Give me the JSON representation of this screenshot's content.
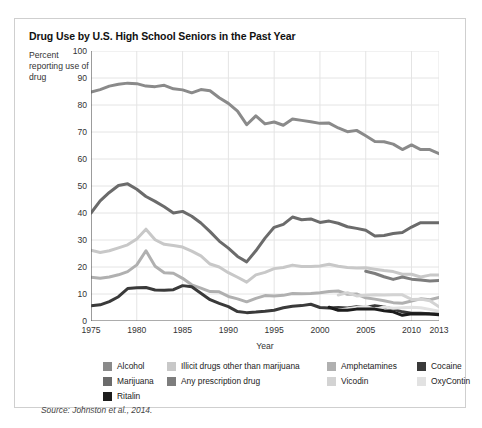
{
  "figure": {
    "title": "Drug Use by U.S. High School Seniors in the Past Year",
    "y_axis_caption": "Percent reporting use of drug",
    "source": "Source: Johnston et al., 2014."
  },
  "chart_data": {
    "type": "line",
    "title": "Drug Use by U.S. High School Seniors in the Past Year",
    "xlabel": "Year",
    "ylabel": "Percent reporting use of drug",
    "xlim": [
      1975,
      2013
    ],
    "ylim": [
      0,
      100
    ],
    "xticks": [
      1975,
      1980,
      1985,
      1990,
      1995,
      2000,
      2005,
      2010,
      2013
    ],
    "yticks": [
      0,
      10,
      20,
      30,
      40,
      50,
      60,
      70,
      80,
      90,
      100
    ],
    "grid": true,
    "legend_position": "below",
    "x": [
      1975,
      1976,
      1977,
      1978,
      1979,
      1980,
      1981,
      1982,
      1983,
      1984,
      1985,
      1986,
      1987,
      1988,
      1989,
      1990,
      1991,
      1992,
      1993,
      1994,
      1995,
      1996,
      1997,
      1998,
      1999,
      2000,
      2001,
      2002,
      2003,
      2004,
      2005,
      2006,
      2007,
      2008,
      2009,
      2010,
      2011,
      2012,
      2013
    ],
    "series": [
      {
        "name": "Alcohol",
        "color": "#8a8a8a",
        "x": [
          1975,
          1976,
          1977,
          1978,
          1979,
          1980,
          1981,
          1982,
          1983,
          1984,
          1985,
          1986,
          1987,
          1988,
          1989,
          1990,
          1991,
          1992,
          1993,
          1994,
          1995,
          1996,
          1997,
          1998,
          1999,
          2000,
          2001,
          2002,
          2003,
          2004,
          2005,
          2006,
          2007,
          2008,
          2009,
          2010,
          2011,
          2012,
          2013
        ],
        "values": [
          84.8,
          85.7,
          87.0,
          87.7,
          88.1,
          87.9,
          87.0,
          86.8,
          87.3,
          86.0,
          85.6,
          84.5,
          85.7,
          85.3,
          82.7,
          80.6,
          77.7,
          72.7,
          76.0,
          73.0,
          73.7,
          72.5,
          74.8,
          74.3,
          73.8,
          73.2,
          73.3,
          71.5,
          70.1,
          70.6,
          68.6,
          66.5,
          66.4,
          65.5,
          63.5,
          65.2,
          63.5,
          63.5,
          62.0
        ]
      },
      {
        "name": "Marijuana",
        "color": "#6b6b6b",
        "x": [
          1975,
          1976,
          1977,
          1978,
          1979,
          1980,
          1981,
          1982,
          1983,
          1984,
          1985,
          1986,
          1987,
          1988,
          1989,
          1990,
          1991,
          1992,
          1993,
          1994,
          1995,
          1996,
          1997,
          1998,
          1999,
          2000,
          2001,
          2002,
          2003,
          2004,
          2005,
          2006,
          2007,
          2008,
          2009,
          2010,
          2011,
          2012,
          2013
        ],
        "values": [
          40.0,
          44.5,
          47.6,
          50.2,
          50.8,
          48.8,
          46.1,
          44.3,
          42.3,
          40.0,
          40.6,
          38.8,
          36.3,
          33.1,
          29.6,
          27.0,
          23.9,
          21.9,
          26.0,
          30.7,
          34.7,
          35.8,
          38.5,
          37.5,
          37.8,
          36.5,
          37.0,
          36.2,
          34.9,
          34.3,
          33.6,
          31.5,
          31.7,
          32.4,
          32.8,
          34.8,
          36.4,
          36.4,
          36.4
        ]
      },
      {
        "name": "Illicit drugs other than marijuana",
        "color": "#c8c8c8",
        "x": [
          1975,
          1976,
          1977,
          1978,
          1979,
          1980,
          1981,
          1982,
          1983,
          1984,
          1985,
          1986,
          1987,
          1988,
          1989,
          1990,
          1991,
          1992,
          1993,
          1994,
          1995,
          1996,
          1997,
          1998,
          1999,
          2000,
          2001,
          2002,
          2003,
          2004,
          2005,
          2006,
          2007,
          2008,
          2009,
          2010,
          2011,
          2012,
          2013
        ],
        "values": [
          26.2,
          25.4,
          26.0,
          27.1,
          28.2,
          30.4,
          34.0,
          30.1,
          28.4,
          28.0,
          27.4,
          25.9,
          24.1,
          21.1,
          20.0,
          17.9,
          16.2,
          14.4,
          17.1,
          18.0,
          19.4,
          19.8,
          20.7,
          20.2,
          20.2,
          20.4,
          21.0,
          20.3,
          19.8,
          19.6,
          19.7,
          19.2,
          18.7,
          18.3,
          17.3,
          17.3,
          16.3,
          17.0,
          17.0
        ]
      },
      {
        "name": "Any prescription drug",
        "color": "#7d7d7d",
        "x": [
          2005,
          2006,
          2007,
          2008,
          2009,
          2010,
          2011,
          2012,
          2013
        ],
        "values": [
          18.4,
          17.6,
          16.4,
          15.4,
          16.3,
          15.5,
          15.2,
          14.8,
          15.0
        ]
      },
      {
        "name": "Amphetamines",
        "color": "#b0b0b0",
        "x": [
          1975,
          1976,
          1977,
          1978,
          1979,
          1980,
          1981,
          1982,
          1983,
          1984,
          1985,
          1986,
          1987,
          1988,
          1989,
          1990,
          1991,
          1992,
          1993,
          1994,
          1995,
          1996,
          1997,
          1998,
          1999,
          2000,
          2001,
          2002,
          2003,
          2004,
          2005,
          2006,
          2007,
          2008,
          2009,
          2010,
          2011,
          2012,
          2013
        ],
        "values": [
          16.2,
          15.8,
          16.3,
          17.1,
          18.3,
          20.8,
          26.0,
          20.3,
          17.9,
          17.7,
          15.8,
          13.4,
          12.2,
          10.9,
          10.8,
          9.1,
          8.2,
          7.1,
          8.4,
          9.4,
          9.3,
          9.5,
          10.2,
          10.1,
          10.2,
          10.5,
          10.9,
          11.1,
          9.9,
          10.0,
          8.6,
          8.1,
          7.5,
          6.8,
          6.6,
          7.4,
          8.2,
          7.9,
          8.7
        ]
      },
      {
        "name": "Vicodin",
        "color": "#d3d3d3",
        "x": [
          2002,
          2003,
          2004,
          2005,
          2006,
          2007,
          2008,
          2009,
          2010,
          2011,
          2012,
          2013
        ],
        "values": [
          9.6,
          10.5,
          9.3,
          9.5,
          9.7,
          9.6,
          9.7,
          9.7,
          8.0,
          8.1,
          7.5,
          5.3
        ]
      },
      {
        "name": "Cocaine",
        "color": "#3a3a3a",
        "x": [
          1975,
          1976,
          1977,
          1978,
          1979,
          1980,
          1981,
          1982,
          1983,
          1984,
          1985,
          1986,
          1987,
          1988,
          1989,
          1990,
          1991,
          1992,
          1993,
          1994,
          1995,
          1996,
          1997,
          1998,
          1999,
          2000,
          2001,
          2002,
          2003,
          2004,
          2005,
          2006,
          2007,
          2008,
          2009,
          2010,
          2011,
          2012,
          2013
        ],
        "values": [
          5.6,
          6.0,
          7.2,
          9.0,
          12.0,
          12.3,
          12.4,
          11.5,
          11.4,
          11.6,
          13.1,
          12.7,
          10.3,
          7.9,
          6.5,
          5.3,
          3.5,
          3.1,
          3.3,
          3.6,
          4.0,
          4.9,
          5.5,
          5.7,
          6.2,
          5.0,
          4.8,
          5.0,
          4.8,
          5.3,
          5.1,
          5.7,
          5.2,
          4.4,
          3.4,
          2.9,
          2.9,
          2.7,
          2.6
        ]
      },
      {
        "name": "OxyContin",
        "color": "#e2e2e2",
        "x": [
          2002,
          2003,
          2004,
          2005,
          2006,
          2007,
          2008,
          2009,
          2010,
          2011,
          2012,
          2013
        ],
        "values": [
          4.0,
          4.5,
          5.0,
          5.5,
          4.3,
          5.2,
          4.7,
          4.9,
          5.1,
          4.9,
          4.3,
          3.6
        ]
      },
      {
        "name": "Ritalin",
        "color": "#1c1c1c",
        "x": [
          2001,
          2002,
          2003,
          2004,
          2005,
          2006,
          2007,
          2008,
          2009,
          2010,
          2011,
          2012,
          2013
        ],
        "values": [
          5.1,
          4.0,
          4.0,
          4.4,
          4.4,
          4.4,
          3.8,
          3.4,
          2.1,
          2.7,
          2.6,
          2.6,
          2.3
        ]
      }
    ]
  },
  "legend": {
    "items": [
      {
        "label": "Alcohol",
        "color": "#8a8a8a",
        "col": 0,
        "row": 0
      },
      {
        "label": "Marijuana",
        "color": "#6b6b6b",
        "col": 0,
        "row": 1
      },
      {
        "label": "Ritalin",
        "color": "#1c1c1c",
        "col": 0,
        "row": 2
      },
      {
        "label": "Illicit drugs other than marijuana",
        "color": "#c8c8c8",
        "col": 1,
        "row": 0
      },
      {
        "label": "Any prescription drug",
        "color": "#7d7d7d",
        "col": 1,
        "row": 1
      },
      {
        "label": "Amphetamines",
        "color": "#b0b0b0",
        "col": 2,
        "row": 0
      },
      {
        "label": "Vicodin",
        "color": "#d3d3d3",
        "col": 2,
        "row": 1
      },
      {
        "label": "Cocaine",
        "color": "#3a3a3a",
        "col": 3,
        "row": 0
      },
      {
        "label": "OxyContin",
        "color": "#e2e2e2",
        "col": 3,
        "row": 1
      }
    ],
    "column_x": [
      16,
      80,
      240,
      330
    ],
    "row_y": [
      2,
      17,
      32
    ]
  }
}
